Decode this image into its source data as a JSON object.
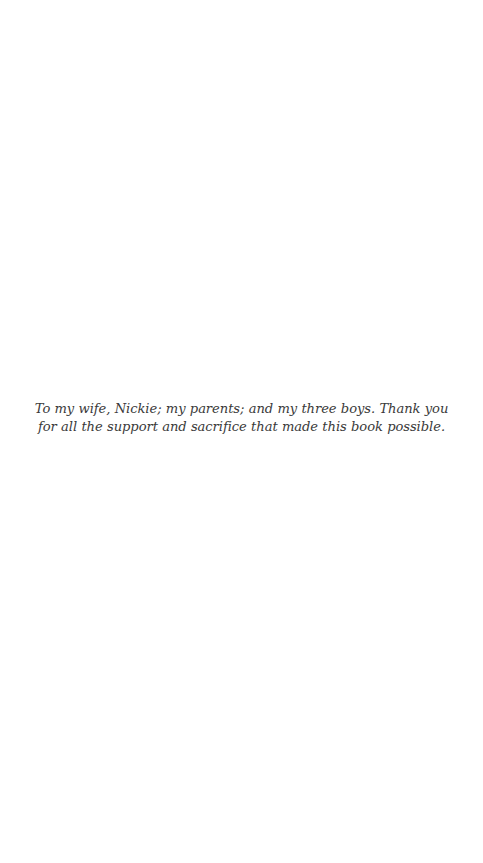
{
  "page": {
    "background_color": "#ffffff",
    "text_color": "#3a3a3a",
    "type": "dedication-page"
  },
  "dedication": {
    "line_1": "To my wife, Nickie; my parents; and my three boys.  Thank you for all the support",
    "line_2": "and sacrifice that made this book possible.",
    "full_text": "To my wife, Nickie; my parents; and my three boys.  Thank you for all the support and sacrifice that made this book possible."
  }
}
